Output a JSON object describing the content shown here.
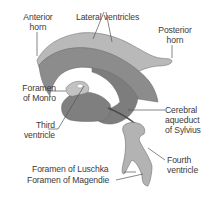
{
  "diagram": {
    "colors": {
      "lateral_ventricle_light": "#b9b9b9",
      "lateral_ventricle_dark": "#8c8c8c",
      "third_ventricle": "#7d7d7d",
      "fourth_ventricle": "#b3b3b3",
      "outline": "#6e6e6e",
      "leader_line": "#555555",
      "label_text": "#3a3a3a",
      "background": "#ffffff"
    },
    "labels": {
      "anterior_horn": [
        "Anterior",
        "horn"
      ],
      "lateral_ventricles": "Lateral ventricles",
      "posterior_horn": [
        "Posterior",
        "horn"
      ],
      "foramen_of_monro": [
        "Foramen",
        "of Monro"
      ],
      "third_ventricle": [
        "Third",
        "ventricle"
      ],
      "cerebral_aqueduct": [
        "Cerebral",
        "aqueduct",
        "of Sylvius"
      ],
      "foramen_of_luschka": "Foramen of Luschka",
      "fourth_ventricle": [
        "Fourth",
        "ventricle"
      ],
      "foramen_of_magendie": "Foramen of Magendie"
    }
  }
}
